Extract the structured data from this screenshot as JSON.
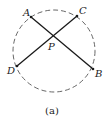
{
  "figure": {
    "caption": "(a)",
    "colors": {
      "circle": "#555555",
      "chord": "#1a1a1a",
      "text": "#222222"
    },
    "circle": {
      "cx": 54,
      "cy": 51,
      "r": 41,
      "style": "dashed"
    },
    "points": {
      "A": {
        "label": "A",
        "x": 31,
        "y": 17
      },
      "B": {
        "label": "B",
        "x": 93,
        "y": 69
      },
      "C": {
        "label": "C",
        "x": 77,
        "y": 16
      },
      "D": {
        "label": "D",
        "x": 17,
        "y": 66
      },
      "P": {
        "label": "P",
        "x": 54,
        "y": 37
      }
    },
    "chords": [
      {
        "from": "A",
        "to": "B"
      },
      {
        "from": "C",
        "to": "D"
      }
    ]
  }
}
